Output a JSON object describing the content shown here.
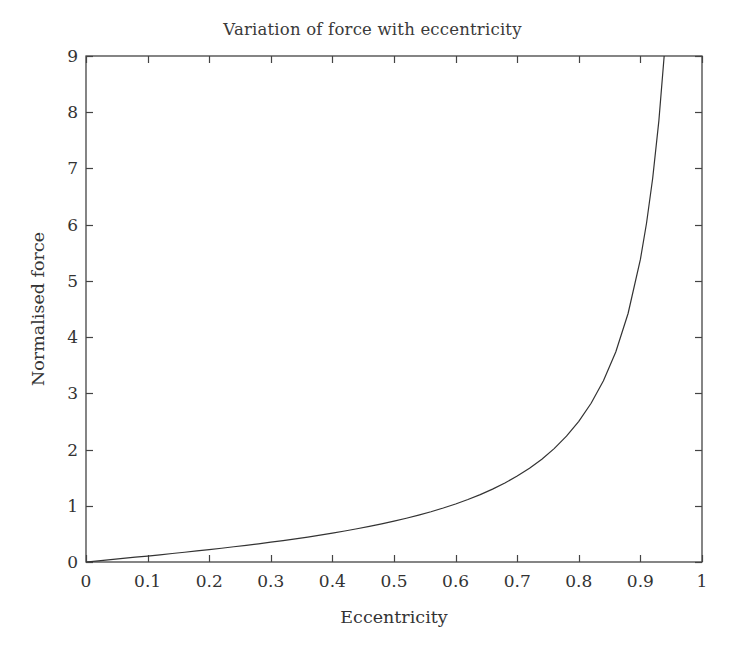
{
  "chart_data": {
    "type": "line",
    "title": "Variation of force with eccentricity",
    "xlabel": "Eccentricity",
    "ylabel": "Normalised force",
    "xlim": [
      0,
      1
    ],
    "ylim": [
      0,
      9
    ],
    "grid": false,
    "legend": null,
    "xticks": [
      "0",
      "0.1",
      "0.2",
      "0.3",
      "0.4",
      "0.5",
      "0.6",
      "0.7",
      "0.8",
      "0.9",
      "1"
    ],
    "xtick_values": [
      0,
      0.1,
      0.2,
      0.3,
      0.4,
      0.5,
      0.6,
      0.7,
      0.8,
      0.9,
      1
    ],
    "yticks": [
      "0",
      "1",
      "2",
      "3",
      "4",
      "5",
      "6",
      "7",
      "8",
      "9"
    ],
    "ytick_values": [
      0,
      1,
      2,
      3,
      4,
      5,
      6,
      7,
      8,
      9
    ],
    "line_color": "#333333",
    "line_width": 1.2,
    "axis_color": "#444444",
    "background_color": "#ffffff",
    "series": [
      {
        "name": "Normalised force",
        "x": [
          0,
          0.02,
          0.04,
          0.06,
          0.08,
          0.1,
          0.12,
          0.14,
          0.16,
          0.18,
          0.2,
          0.22,
          0.24,
          0.26,
          0.28,
          0.3,
          0.32,
          0.34,
          0.36,
          0.38,
          0.4,
          0.42,
          0.44,
          0.46,
          0.48,
          0.5,
          0.52,
          0.54,
          0.56,
          0.58,
          0.6,
          0.62,
          0.64,
          0.66,
          0.68,
          0.7,
          0.72,
          0.74,
          0.76,
          0.78,
          0.8,
          0.82,
          0.84,
          0.86,
          0.88,
          0.9,
          0.91,
          0.92,
          0.93,
          0.94,
          0.95,
          0.955,
          0.96,
          0.965,
          0.97,
          0.973,
          0.976,
          0.978,
          0.98,
          0.982,
          0.984,
          0.986,
          0.988,
          0.99
        ],
        "y": [
          0,
          0.021,
          0.042,
          0.063,
          0.085,
          0.106,
          0.128,
          0.151,
          0.173,
          0.197,
          0.221,
          0.245,
          0.271,
          0.297,
          0.324,
          0.352,
          0.381,
          0.412,
          0.444,
          0.478,
          0.513,
          0.551,
          0.591,
          0.633,
          0.678,
          0.726,
          0.778,
          0.834,
          0.894,
          0.96,
          1.032,
          1.111,
          1.199,
          1.296,
          1.405,
          1.528,
          1.668,
          1.829,
          2.017,
          2.238,
          2.502,
          2.824,
          3.224,
          3.736,
          4.42,
          5.382,
          6.03,
          6.83,
          7.85,
          9.19,
          11.0,
          12.2,
          13.6,
          15.4,
          17.7,
          19.6,
          21.9,
          23.7,
          25.8,
          28.3,
          31.3,
          35.1,
          39.8,
          45.9
        ],
        "note": "Curve rises near-linearly for small eccentricity then diverges sharply toward eccentricity = 1; plotted portion is clipped at the top of the axis at a normalised force of 9."
      }
    ]
  },
  "plot_geometry": {
    "left": 86,
    "top": 56,
    "right": 702,
    "bottom": 562
  }
}
